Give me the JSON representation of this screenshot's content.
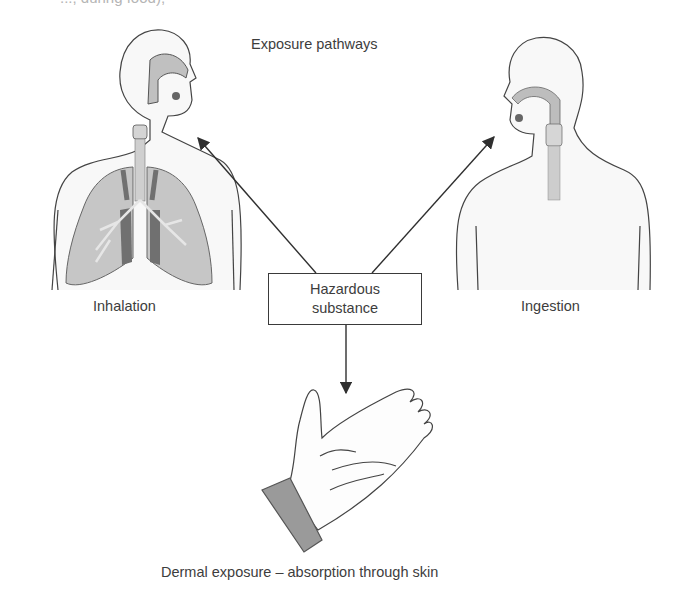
{
  "header": {
    "cutoff_text": "..., during food),",
    "title": "Exposure pathways"
  },
  "source": {
    "line1": "Hazardous",
    "line2": "substance"
  },
  "pathways": [
    {
      "label": "Inhalation",
      "figure": "human-torso-with-lungs",
      "arrow": "up-left"
    },
    {
      "label": "Ingestion",
      "figure": "human-torso-with-esophagus",
      "arrow": "up-right"
    },
    {
      "label": "Dermal exposure – absorption through skin",
      "figure": "open-hand",
      "arrow": "down"
    }
  ],
  "colors": {
    "line": "#3a3a3a",
    "skin_fill": "#f7f7f7",
    "lung_fill": "#c4c4c4",
    "lung_dark": "#6e6e6e",
    "airway": "#bdbdbd",
    "cuff": "#9a9a9a"
  }
}
